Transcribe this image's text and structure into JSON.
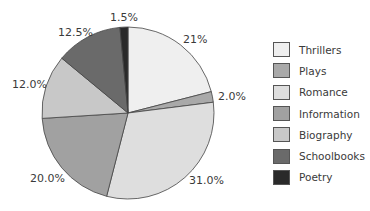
{
  "chart_data": {
    "type": "pie",
    "title": "",
    "start_angle_deg": 0,
    "direction": "clockwise",
    "categories": [
      "Thrillers",
      "Plays",
      "Romance",
      "Information",
      "Biography",
      "Schoolbooks",
      "Poetry"
    ],
    "values": [
      21,
      2.0,
      31.0,
      20.0,
      12.0,
      12.5,
      1.5
    ],
    "labels": [
      "21%",
      "2.0%",
      "31.0%",
      "20.0%",
      "12.0%",
      "12.5%",
      "1.5%"
    ],
    "colors": [
      "#efefef",
      "#a9a9a9",
      "#dedede",
      "#a1a1a1",
      "#c8c8c8",
      "#6a6a6a",
      "#2a2a2a"
    ],
    "legend_position": "right"
  },
  "legend": {
    "items": [
      {
        "label": "Thrillers",
        "color": "#efefef"
      },
      {
        "label": "Plays",
        "color": "#a9a9a9"
      },
      {
        "label": "Romance",
        "color": "#dedede"
      },
      {
        "label": "Information",
        "color": "#a1a1a1"
      },
      {
        "label": "Biography",
        "color": "#c8c8c8"
      },
      {
        "label": "Schoolbooks",
        "color": "#6a6a6a"
      },
      {
        "label": "Poetry",
        "color": "#2a2a2a"
      }
    ]
  },
  "slice_labels": [
    {
      "text": "21%",
      "x": 183,
      "y": 33
    },
    {
      "text": "2.0%",
      "x": 218,
      "y": 90
    },
    {
      "text": "31.0%",
      "x": 189,
      "y": 174
    },
    {
      "text": "20.0%",
      "x": 30,
      "y": 172
    },
    {
      "text": "12.0%",
      "x": 12,
      "y": 78
    },
    {
      "text": "12.5%",
      "x": 58,
      "y": 26
    },
    {
      "text": "1.5%",
      "x": 110,
      "y": 11
    }
  ]
}
